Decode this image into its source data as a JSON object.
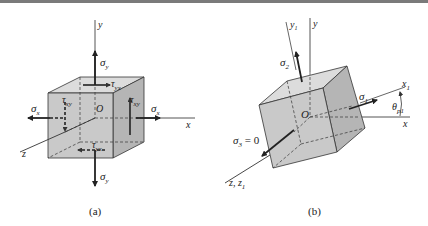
{
  "figure": {
    "panels": [
      {
        "id": "a",
        "caption": "(a)",
        "axes": {
          "x": "x",
          "y": "y",
          "z": "z",
          "origin": "O"
        },
        "stresses": {
          "sigma_x_left": "σ",
          "sigma_x_left_sub": "x",
          "sigma_x_right": "σ",
          "sigma_x_right_sub": "x",
          "sigma_y_top": "σ",
          "sigma_y_top_sub": "y",
          "sigma_y_bottom": "σ",
          "sigma_y_bottom_sub": "y",
          "tau_yx_top": "τ",
          "tau_yx_top_sub": "yx",
          "tau_yx_bottom": "τ",
          "tau_yx_bottom_sub": "yx",
          "tau_xy_left": "τ",
          "tau_xy_left_sub": "xy",
          "tau_xy_right": "τ",
          "tau_xy_right_sub": "xy"
        }
      },
      {
        "id": "b",
        "caption": "(b)",
        "axes": {
          "x": "x",
          "y": "y",
          "x1": "x",
          "x1_sub": "1",
          "y1": "y",
          "y1_sub": "1",
          "z": "z, z",
          "z_sub": "1",
          "origin": "O"
        },
        "stresses": {
          "sigma_1": "σ",
          "sigma_1_sub": "1",
          "sigma_2": "σ",
          "sigma_2_sub": "2",
          "sigma_3": "σ",
          "sigma_3_sub": "3",
          "sigma_3_eq": " = 0"
        },
        "angle": {
          "symbol": "θ",
          "sub": "p1"
        }
      }
    ],
    "colors": {
      "cube_front": "#c9c9c9",
      "cube_side": "#b5b5b5",
      "cube_top": "#dcdcdc",
      "line": "#333333",
      "arrow": "#222222"
    }
  }
}
